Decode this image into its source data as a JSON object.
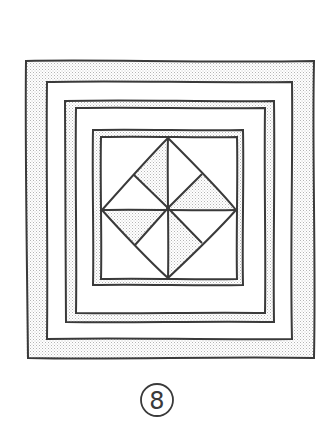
{
  "diagram": {
    "type": "quilt-block",
    "style": "hand-drawn pen sketch",
    "colors": {
      "background": "#ffffff",
      "ink": "#3a3a3a",
      "shade": "#e4e4e4"
    },
    "borders": [
      {
        "name": "outer-border-band",
        "outer": [
          26,
          61,
          314,
          358
        ],
        "inner": [
          47,
          82,
          292,
          339
        ],
        "shaded": true
      },
      {
        "name": "middle-border-band",
        "outer": [
          65,
          101,
          274,
          322
        ],
        "inner": [
          76,
          108,
          265,
          313
        ],
        "shaded": true
      },
      {
        "name": "inner-border-band",
        "outer": [
          93,
          130,
          243,
          285
        ],
        "inner": [
          101,
          137,
          237,
          279
        ],
        "shaded": true
      }
    ],
    "center_block": {
      "description": "Square-in-a-square with pinwheel of 8 triangles",
      "center": [
        169,
        208
      ],
      "diamond_points": [
        [
          168,
          138
        ],
        [
          236,
          210
        ],
        [
          168,
          278
        ],
        [
          102,
          210
        ]
      ],
      "shaded_triangles": 4,
      "unshaded_triangles": 4
    },
    "label": {
      "text": "8",
      "circled": true,
      "center": [
        157,
        400
      ]
    }
  }
}
